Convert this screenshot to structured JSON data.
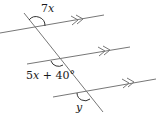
{
  "diagram": {
    "type": "parallel-lines-transversal",
    "colors": {
      "line": "#777777",
      "arc": "#333333",
      "text": "#1a1a1a",
      "background": "#ffffff"
    },
    "parallel_lines": [
      {
        "name": "line-1",
        "x1": 0,
        "y1": 33,
        "x2": 104,
        "y2": 15,
        "arrow": "double"
      },
      {
        "name": "line-2",
        "x1": 27,
        "y1": 64,
        "x2": 130,
        "y2": 47,
        "arrow": "double"
      },
      {
        "name": "line-3",
        "x1": 53,
        "y1": 97,
        "x2": 156,
        "y2": 79,
        "arrow": "double"
      }
    ],
    "transversal": {
      "x1": 24,
      "y1": 13,
      "x2": 103,
      "y2": 112
    },
    "angles": [
      {
        "label_var": "7",
        "label_x": "x",
        "position": "top-left at line-1"
      },
      {
        "label_var": "5",
        "label_x": "x",
        "label_rest": " + 40°",
        "position": "bottom-left at line-2"
      },
      {
        "label_var": "y",
        "position": "bottom-left at line-3"
      }
    ]
  }
}
